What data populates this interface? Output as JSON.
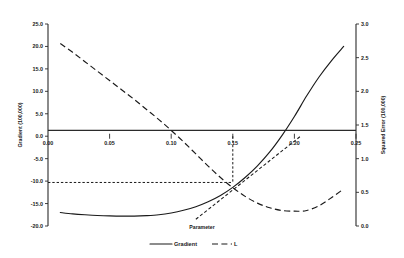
{
  "chart_data": {
    "type": "line",
    "title": "",
    "xlabel": "Parameter",
    "ylabel": "Gradient (100,000)",
    "y2label": "Squared Error (100,000)",
    "xlim": [
      0.0,
      0.25
    ],
    "ylim": [
      -20.0,
      25.0
    ],
    "y2lim": [
      0.0,
      3.0
    ],
    "grid": false,
    "legend_position": "bottom-center",
    "xticks": [
      "0.00",
      "0.05",
      "0.10",
      "0.15",
      "0.20",
      "0.25"
    ],
    "xtick_values": [
      0.0,
      0.05,
      0.1,
      0.15,
      0.2,
      0.25
    ],
    "yticks": [
      "-20.0",
      "-15.0",
      "-10.0",
      "-5.0",
      "0.0",
      "5.0",
      "10.0",
      "15.0",
      "20.0",
      "25.0"
    ],
    "ytick_values": [
      -20.0,
      -15.0,
      -10.0,
      -5.0,
      0.0,
      5.0,
      10.0,
      15.0,
      20.0,
      25.0
    ],
    "y2ticks": [
      "0.0",
      "0.5",
      "1.0",
      "1.5",
      "2.0",
      "2.5",
      "3.0"
    ],
    "y2tick_values": [
      0.0,
      0.5,
      1.0,
      1.5,
      2.0,
      2.5,
      3.0
    ],
    "zero_line_y": 0.0,
    "series": [
      {
        "name": "Gradient",
        "axis": "left",
        "style": "solid",
        "x": [
          0.01,
          0.02,
          0.03,
          0.04,
          0.05,
          0.06,
          0.07,
          0.08,
          0.09,
          0.1,
          0.11,
          0.12,
          0.13,
          0.14,
          0.15,
          0.16,
          0.17,
          0.18,
          0.19,
          0.2,
          0.21,
          0.22,
          0.23,
          0.24
        ],
        "values": [
          -17.0,
          -17.3,
          -17.5,
          -17.65,
          -17.75,
          -17.8,
          -17.8,
          -17.7,
          -17.5,
          -17.1,
          -16.5,
          -15.7,
          -14.6,
          -13.2,
          -11.4,
          -9.2,
          -6.6,
          -3.5,
          0.2,
          4.4,
          9.0,
          13.2,
          16.8,
          20.0
        ]
      },
      {
        "name": "L",
        "axis": "right",
        "style": "long-dash",
        "x": [
          0.01,
          0.02,
          0.03,
          0.04,
          0.05,
          0.06,
          0.07,
          0.08,
          0.09,
          0.1,
          0.11,
          0.12,
          0.13,
          0.14,
          0.15,
          0.16,
          0.17,
          0.18,
          0.19,
          0.2,
          0.205,
          0.21,
          0.22,
          0.23,
          0.24
        ],
        "values": [
          2.71,
          2.58,
          2.44,
          2.3,
          2.16,
          2.02,
          1.88,
          1.73,
          1.58,
          1.42,
          1.25,
          1.07,
          0.89,
          0.72,
          0.57,
          0.44,
          0.34,
          0.27,
          0.23,
          0.22,
          0.22,
          0.23,
          0.3,
          0.42,
          0.55
        ]
      }
    ],
    "tangent_segment": {
      "name": "tangent",
      "axis": "left",
      "style": "short-dash",
      "x": [
        0.12,
        0.205
      ],
      "values": [
        -18.5,
        0.0
      ]
    },
    "guides": [
      {
        "name": "vertical-guide",
        "x": 0.15,
        "y_from": 0.0,
        "y_to": -10.3
      },
      {
        "name": "horizontal-guide",
        "y": -10.3,
        "x_from": 0.0,
        "x_to": 0.15
      }
    ],
    "legend": [
      {
        "label": "Gradient",
        "style": "solid"
      },
      {
        "label": "L",
        "style": "long-dash"
      }
    ]
  }
}
